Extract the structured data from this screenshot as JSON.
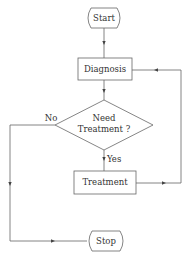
{
  "diagram": {
    "type": "flowchart",
    "nodes": [
      {
        "id": "start",
        "shape": "terminal",
        "label": "Start"
      },
      {
        "id": "diagnosis",
        "shape": "process",
        "label": "Diagnosis"
      },
      {
        "id": "decision",
        "shape": "decision",
        "label_line1": "Need",
        "label_line2": "Treatment ?"
      },
      {
        "id": "treatment",
        "shape": "process",
        "label": "Treatment"
      },
      {
        "id": "stop",
        "shape": "terminal",
        "label": "Stop"
      }
    ],
    "edges": [
      {
        "from": "start",
        "to": "diagnosis",
        "label": ""
      },
      {
        "from": "diagnosis",
        "to": "decision",
        "label": ""
      },
      {
        "from": "decision",
        "to": "treatment",
        "label": "Yes"
      },
      {
        "from": "decision",
        "to": "stop",
        "label": "No"
      },
      {
        "from": "treatment",
        "to": "diagnosis",
        "label": ""
      }
    ],
    "colors": {
      "line": "#555555",
      "text": "#333333",
      "background": "#ffffff"
    }
  }
}
